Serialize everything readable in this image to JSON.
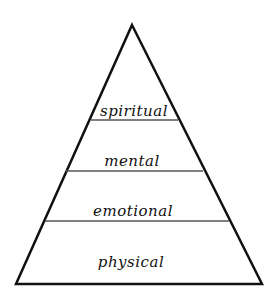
{
  "diagram": {
    "type": "pyramid",
    "stroke_color": "#111111",
    "fill_color": "#ffffff",
    "levels": [
      {
        "label": "spiritual",
        "position": "top"
      },
      {
        "label": "mental",
        "position": "upper-middle"
      },
      {
        "label": "emotional",
        "position": "lower-middle"
      },
      {
        "label": "physical",
        "position": "base"
      }
    ]
  }
}
